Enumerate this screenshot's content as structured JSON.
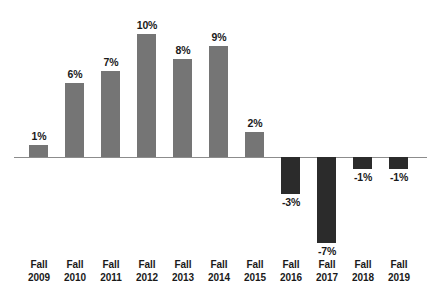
{
  "chart_data": {
    "type": "bar",
    "title": "",
    "subtitle": "",
    "xlabel": "",
    "ylabel": "",
    "grid": false,
    "legend": "none",
    "ylim": [
      -8,
      11
    ],
    "axis_zero_line": true,
    "categories": [
      "Fall 2009",
      "Fall 2010",
      "Fall 2011",
      "Fall 2012",
      "Fall 2013",
      "Fall 2014",
      "Fall 2015",
      "Fall 2016",
      "Fall 2017",
      "Fall 2018",
      "Fall 2019"
    ],
    "category_lines": [
      [
        "Fall",
        "2009"
      ],
      [
        "Fall",
        "2010"
      ],
      [
        "Fall",
        "2011"
      ],
      [
        "Fall",
        "2012"
      ],
      [
        "Fall",
        "2013"
      ],
      [
        "Fall",
        "2014"
      ],
      [
        "Fall",
        "2015"
      ],
      [
        "Fall",
        "2016"
      ],
      [
        "Fall",
        "2017"
      ],
      [
        "Fall",
        "2018"
      ],
      [
        "Fall",
        "2019"
      ]
    ],
    "values": [
      1,
      6,
      7,
      10,
      8,
      9,
      2,
      -3,
      -7,
      -1,
      -1
    ],
    "data_labels": [
      "1%",
      "6%",
      "7%",
      "10%",
      "8%",
      "9%",
      "2%",
      "-3%",
      "-7%",
      "-1%",
      "-1%"
    ],
    "colors": {
      "positive_bar": "#757575",
      "negative_bar": "#2b2b2b",
      "axis_line": "#8c8c8c",
      "label_text": "#1a1a1a",
      "background": "#ffffff"
    }
  }
}
